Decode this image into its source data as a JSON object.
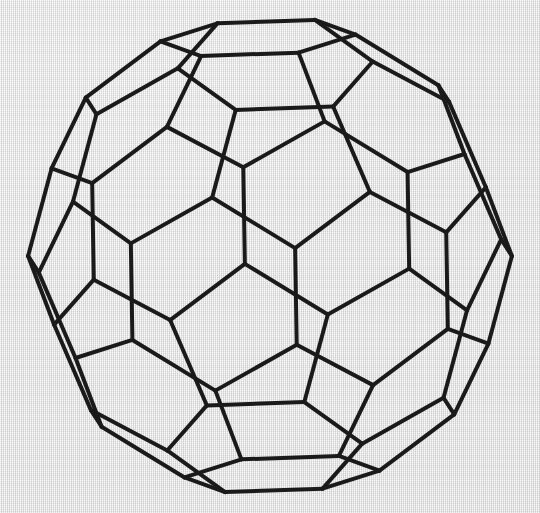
{
  "canvas": {
    "width": 540,
    "height": 513,
    "background_color": "#e1e1e1",
    "texture": "woven-paper"
  },
  "figure": {
    "name": "truncated-icosahedron-wireframe",
    "title": "Truncated icosahedron (buckyball) wireframe",
    "stroke_color": "#1a1a1a",
    "stroke_width": 4.0,
    "fill": "none",
    "transparent": true,
    "center_x": 270,
    "center_y": 256,
    "radius": 243,
    "vertices": 60,
    "edges": 90,
    "faces": 32,
    "pentagon_faces": 12,
    "hexagon_faces": 20,
    "view": {
      "axis": "two-fold",
      "rotation_x_deg": 10,
      "rotation_y_deg": 6,
      "rotation_z_deg": 2,
      "projection": "orthographic"
    },
    "bounds": {
      "left": 27,
      "top": 23,
      "right": 513,
      "bottom": 490
    }
  },
  "chart_data": {
    "type": "diagram",
    "solid": "truncated icosahedron",
    "vertex_count": 60,
    "edge_count": 90,
    "face_count": 32,
    "faces_breakdown": {
      "pentagons": 12,
      "hexagons": 20
    },
    "vertex_configuration": "5.6.6",
    "edge_types": [
      "pentagon-hexagon",
      "hexagon-hexagon"
    ],
    "rendering": "transparent wireframe, all hidden edges shown",
    "line_color": "#1a1a1a",
    "background_color": "#e1e1e1"
  }
}
